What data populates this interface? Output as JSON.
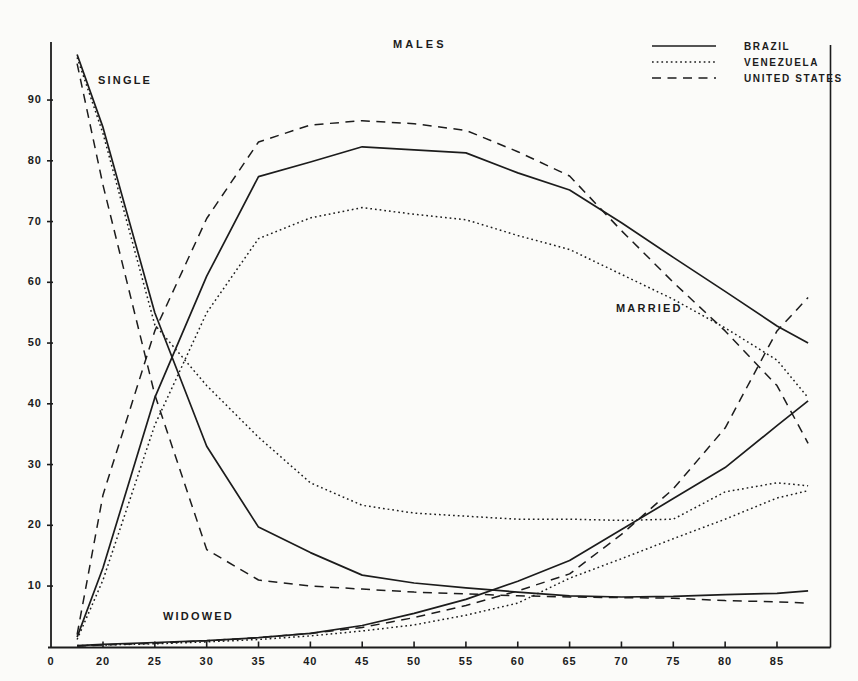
{
  "page": {
    "background": "#fbfbf9",
    "ink": "#1c1c1c"
  },
  "chart_data": {
    "type": "line",
    "title": "MALES",
    "xlabel": "",
    "ylabel": "",
    "ylim": [
      0,
      100
    ],
    "grid": false,
    "legend_position": "top-right",
    "legend": [
      {
        "label": "BRAZIL",
        "line": "solid"
      },
      {
        "label": "VENEZUELA",
        "line": "dotted"
      },
      {
        "label": "UNITED STATES",
        "line": "dashed"
      }
    ],
    "annotations": [
      {
        "text": "SINGLE"
      },
      {
        "text": "MARRIED"
      },
      {
        "text": "WIDOWED"
      }
    ],
    "x_tick_ages": [
      0,
      20,
      25,
      30,
      35,
      40,
      45,
      50,
      55,
      60,
      65,
      70,
      75,
      80,
      85
    ],
    "x_tick_labels": [
      "0",
      "20",
      "25",
      "30",
      "35",
      "40",
      "45",
      "50",
      "55",
      "60",
      "65",
      "70",
      "75",
      "80",
      "85"
    ],
    "y_ticks": [
      10,
      20,
      30,
      40,
      50,
      60,
      70,
      80,
      90
    ],
    "y_tick_labels": [
      "10",
      "20",
      "30",
      "40",
      "50",
      "60",
      "70",
      "80",
      "90"
    ],
    "x": [
      17.5,
      20,
      25,
      30,
      35,
      40,
      45,
      50,
      55,
      60,
      65,
      70,
      75,
      80,
      85,
      88
    ],
    "series": [
      {
        "group": "SINGLE",
        "country": "BRAZIL",
        "line": "solid",
        "values": [
          97.5,
          85.5,
          55,
          33,
          19.7,
          15.5,
          11.8,
          10.5,
          9.7,
          9.0,
          8.4,
          8.2,
          8.3,
          8.6,
          8.8,
          9.2
        ]
      },
      {
        "group": "SINGLE",
        "country": "VENEZUELA",
        "line": "dotted",
        "values": [
          97.0,
          84.5,
          53,
          43,
          34.5,
          27,
          23.3,
          22,
          21.5,
          21,
          21,
          20.8,
          21,
          25.5,
          27,
          26.5
        ]
      },
      {
        "group": "SINGLE",
        "country": "UNITED STATES",
        "line": "dashed",
        "values": [
          96.0,
          76,
          41.5,
          16,
          11,
          10,
          9.5,
          9.0,
          8.7,
          8.4,
          8.2,
          8.1,
          8.0,
          7.6,
          7.4,
          7.2
        ]
      },
      {
        "group": "MARRIED",
        "country": "BRAZIL",
        "line": "solid",
        "values": [
          1.6,
          13,
          41,
          61,
          77.4,
          79.8,
          82.3,
          81.8,
          81.3,
          78,
          75.2,
          69.8,
          64.1,
          58.5,
          52.8,
          50
        ]
      },
      {
        "group": "MARRIED",
        "country": "VENEZUELA",
        "line": "dotted",
        "values": [
          1.2,
          11,
          36.5,
          55,
          67.2,
          70.6,
          72.3,
          71.2,
          70.3,
          67.7,
          65.4,
          61.3,
          57.2,
          52.5,
          47.2,
          41
        ]
      },
      {
        "group": "MARRIED",
        "country": "UNITED STATES",
        "line": "dashed",
        "values": [
          2.0,
          25,
          52,
          70.5,
          83.1,
          85.9,
          86.6,
          86.1,
          85,
          81.5,
          77.5,
          68.5,
          60,
          52,
          43,
          33.5
        ]
      },
      {
        "group": "WIDOWED",
        "country": "BRAZIL",
        "line": "solid",
        "values": [
          0.2,
          0.4,
          0.7,
          1.0,
          1.5,
          2.2,
          3.5,
          5.5,
          7.8,
          10.8,
          14.2,
          19.3,
          24.4,
          29.5,
          36.4,
          40.5
        ]
      },
      {
        "group": "WIDOWED",
        "country": "VENEZUELA",
        "line": "dotted",
        "values": [
          0.2,
          0.3,
          0.5,
          0.8,
          1.2,
          1.8,
          2.6,
          3.6,
          5.2,
          7.2,
          11.3,
          14.5,
          17.8,
          21,
          24.5,
          25.7
        ]
      },
      {
        "group": "WIDOWED",
        "country": "UNITED STATES",
        "line": "dashed",
        "values": [
          0.1,
          0.3,
          0.6,
          1.0,
          1.5,
          2.2,
          3.2,
          4.8,
          6.8,
          9.2,
          12.0,
          18.5,
          26,
          36,
          52,
          57.5
        ]
      }
    ]
  }
}
